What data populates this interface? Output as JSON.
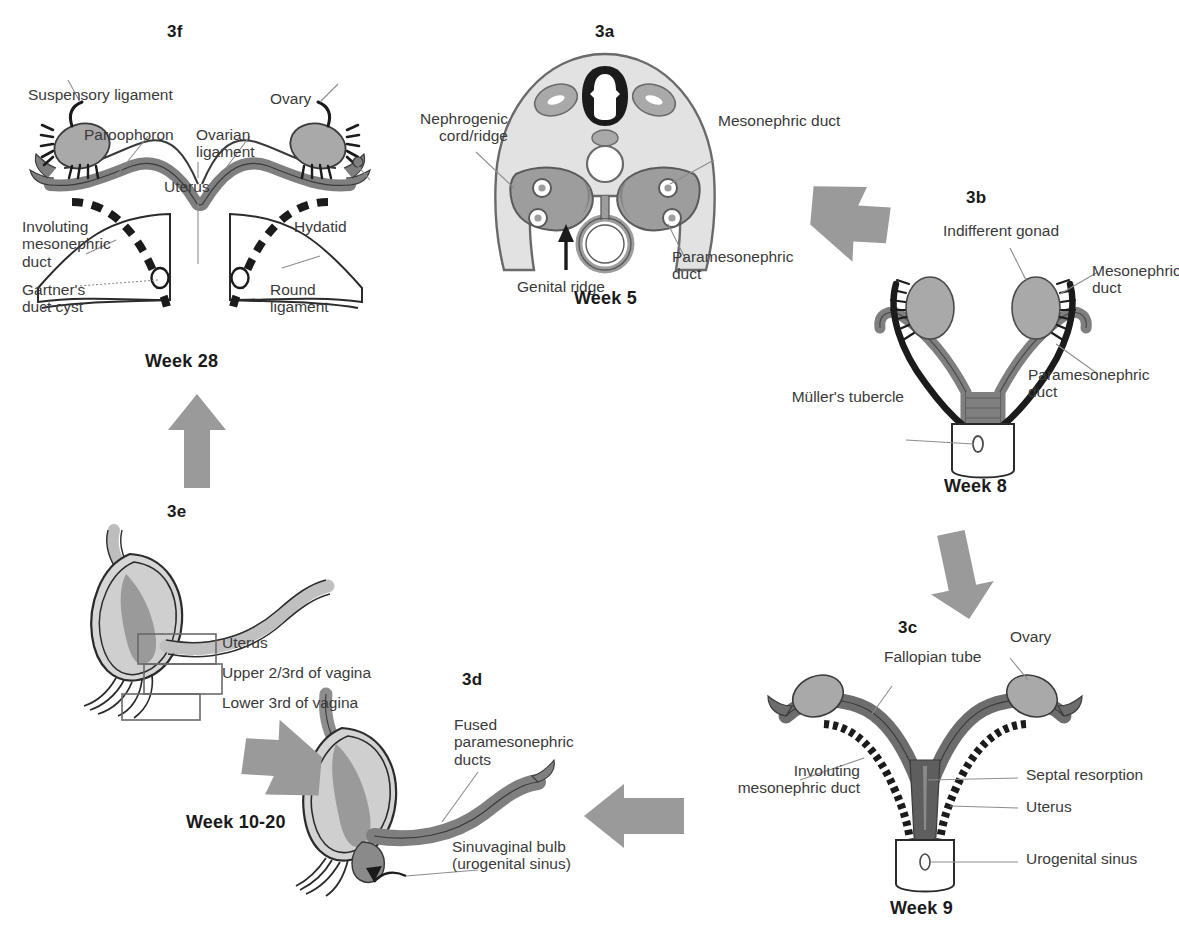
{
  "figure": {
    "type": "medical-illustration",
    "palette": {
      "background": "#ffffff",
      "text": "#3a3a3a",
      "label_bold": "#1a1a1a",
      "arrow_gray": "#9a9a9a",
      "body_fill": "#e2e2e2",
      "mid_gray": "#a9a9a9",
      "duct_gray": "#7f7f7f",
      "dark_gray": "#6a6a6a",
      "black": "#1b1b1b",
      "white": "#ffffff",
      "leader_line": "#8d8d8d"
    }
  },
  "panels": {
    "a": {
      "id": "3a",
      "week": "Week 5",
      "labels": {
        "nephrogenic": "Nephrogenic\ncord/ridge",
        "mesonephric_duct": "Mesonephric duct",
        "genital_ridge": "Genital ridge",
        "paramesonephric_duct": "Paramesonephric\nduct"
      }
    },
    "b": {
      "id": "3b",
      "week": "Week 8",
      "labels": {
        "indifferent_gonad": "Indifferent gonad",
        "mesonephric_duct": "Mesonephric\nduct",
        "paramesonephric_duct": "Paramesonephric\nduct",
        "mullers_tubercle": "Müller's tubercle"
      }
    },
    "c": {
      "id": "3c",
      "week": "Week 9",
      "labels": {
        "fallopian_tube": "Fallopian tube",
        "ovary": "Ovary",
        "involuting_mesonephric_duct": "Involuting\nmesonephric duct",
        "septal_resorption": "Septal resorption",
        "uterus": "Uterus",
        "urogenital_sinus": "Urogenital sinus"
      }
    },
    "d": {
      "id": "3d",
      "labels": {
        "fused_ducts": "Fused\nparamesonephric\nducts",
        "sinuvaginal_bulb": "Sinuvaginal bulb\n(urogenital sinus)"
      }
    },
    "e": {
      "id": "3e",
      "week": "Week 10-20",
      "labels": {
        "uterus": "Uterus",
        "upper_vagina": "Upper 2/3rd of vagina",
        "lower_vagina": "Lower 3rd of vagina"
      }
    },
    "f": {
      "id": "3f",
      "week": "Week 28",
      "labels": {
        "suspensory_ligament": "Suspensory ligament",
        "paroophoron": "Paroophoron",
        "ovarian_ligament": "Ovarian\nligament",
        "ovary": "Ovary",
        "uterus": "Uterus",
        "involuting_mesonephric_duct": "Involuting\nmesonephric\nduct",
        "hydatid": "Hydatid",
        "gartners_duct_cyst": "Gartner's\nduct cyst",
        "round_ligament": "Round\nligament"
      }
    }
  },
  "arrows": [
    {
      "name": "arrow-a-to-b",
      "direction": "down-right"
    },
    {
      "name": "arrow-b-to-c",
      "direction": "down"
    },
    {
      "name": "arrow-c-to-d",
      "direction": "left"
    },
    {
      "name": "arrow-d-to-e",
      "direction": "up-left"
    },
    {
      "name": "arrow-e-to-f",
      "direction": "up"
    }
  ]
}
